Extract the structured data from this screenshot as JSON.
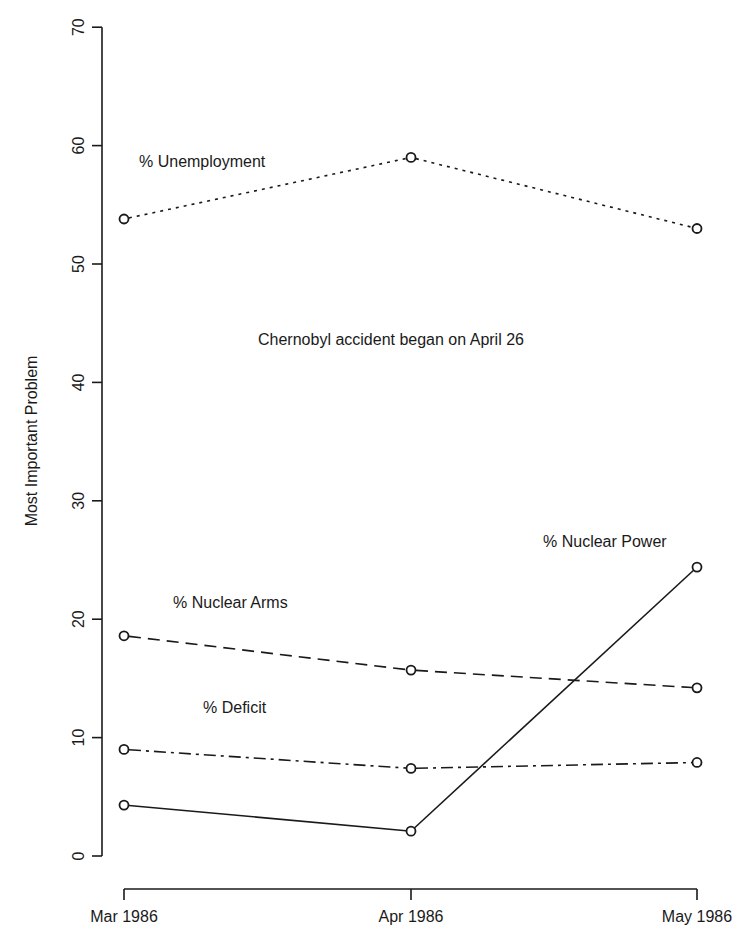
{
  "chart_data": {
    "type": "line",
    "title": "",
    "xlabel": "",
    "ylabel": "Most Important Problem",
    "categories": [
      "Mar 1986",
      "Apr 1986",
      "May 1986"
    ],
    "ylim": [
      0,
      70
    ],
    "yticks": [
      0,
      10,
      20,
      30,
      40,
      50,
      60,
      70
    ],
    "grid": false,
    "legend": "none (direct labels)",
    "series": [
      {
        "name": "% Unemployment",
        "values": [
          53.8,
          59.0,
          53.0
        ],
        "linestyle": "dotted"
      },
      {
        "name": "% Nuclear Arms",
        "values": [
          18.6,
          15.7,
          14.2
        ],
        "linestyle": "dashed"
      },
      {
        "name": "% Deficit",
        "values": [
          9.0,
          7.4,
          7.9
        ],
        "linestyle": "dashdot"
      },
      {
        "name": "% Nuclear Power",
        "values": [
          4.3,
          2.1,
          24.4
        ],
        "linestyle": "solid"
      }
    ],
    "annotations": [
      {
        "text": "% Unemployment",
        "x": 139,
        "y": 167
      },
      {
        "text": "Chernobyl accident began on April 26",
        "x": 258,
        "y": 345
      },
      {
        "text": "% Nuclear Power",
        "x": 543,
        "y": 547
      },
      {
        "text": "% Nuclear Arms",
        "x": 173,
        "y": 608
      },
      {
        "text": "% Deficit",
        "x": 203,
        "y": 713
      }
    ]
  }
}
